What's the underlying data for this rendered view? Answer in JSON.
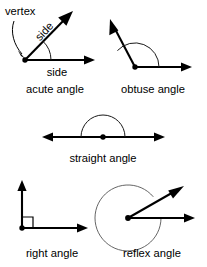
{
  "figure": {
    "background_color": "#ffffff",
    "stroke_color": "#000000",
    "arc_color": "#1a1a1a",
    "reflex_arc_color": "#555555",
    "width": 207,
    "height": 267
  },
  "annotations": {
    "vertex_label": "vertex",
    "side_label_diagonal": "side",
    "side_label_horizontal": "side"
  },
  "panels": [
    {
      "id": "acute",
      "caption": "acute angle",
      "caption_x": 55,
      "caption_y": 90,
      "vertex": {
        "x": 25,
        "y": 60
      },
      "rays": [
        {
          "name": "horizontal-ray",
          "angle_deg": 0,
          "length": 70
        },
        {
          "name": "diagonal-ray",
          "angle_deg": 47,
          "length": 68
        }
      ],
      "arc": {
        "radius": 26,
        "start_deg": 0,
        "end_deg": 47
      },
      "measure_deg": 47
    },
    {
      "id": "obtuse",
      "caption": "obtuse angle",
      "caption_x": 135,
      "caption_y": 90,
      "vertex": {
        "x": 135,
        "y": 67
      },
      "rays": [
        {
          "name": "horizontal-ray",
          "angle_deg": 0,
          "length": 57
        },
        {
          "name": "diagonal-ray",
          "angle_deg": 137,
          "length": 58
        }
      ],
      "arc": {
        "radius": 24,
        "start_deg": 0,
        "end_deg": 137
      },
      "measure_deg": 137
    },
    {
      "id": "straight",
      "caption": "straight angle",
      "caption_x": 103,
      "caption_y": 159,
      "vertex": {
        "x": 103,
        "y": 137
      },
      "rays": [
        {
          "name": "right-ray",
          "angle_deg": 0,
          "length": 62
        },
        {
          "name": "left-ray",
          "angle_deg": 180,
          "length": 61
        }
      ],
      "arc": {
        "radius": 22,
        "start_deg": 0,
        "end_deg": 180
      },
      "measure_deg": 180
    },
    {
      "id": "right",
      "caption": "right angle",
      "caption_x": 52,
      "caption_y": 254,
      "vertex": {
        "x": 22,
        "y": 228
      },
      "rays": [
        {
          "name": "horizontal-ray",
          "angle_deg": 0,
          "length": 66
        },
        {
          "name": "vertical-ray",
          "angle_deg": 90,
          "length": 50
        }
      ],
      "square_marker": {
        "size": 11
      },
      "measure_deg": 90
    },
    {
      "id": "reflex",
      "caption": "reflex angle",
      "caption_x": 152,
      "caption_y": 254,
      "vertex": {
        "x": 128,
        "y": 218
      },
      "rays": [
        {
          "name": "horizontal-ray",
          "angle_deg": 0,
          "length": 67
        },
        {
          "name": "diagonal-ray",
          "angle_deg": 40,
          "length": 72
        }
      ],
      "arc": {
        "radius": 33,
        "start_deg": 40,
        "end_deg": 360
      },
      "measure_deg": 320
    }
  ]
}
